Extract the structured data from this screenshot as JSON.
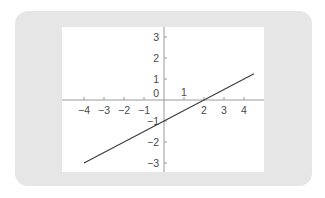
{
  "chart_data": {
    "type": "line",
    "title": "",
    "xlabel": "",
    "ylabel": "",
    "xlim": [
      -5,
      5
    ],
    "ylim": [
      -3.5,
      3.5
    ],
    "grid": false,
    "x_ticks": [
      -4,
      -3,
      -2,
      -1,
      1,
      2,
      3,
      4
    ],
    "y_ticks": [
      -3,
      -2,
      -1,
      1,
      2,
      3
    ],
    "x_tick_labels": [
      "−4",
      "−3",
      "−2",
      "−1",
      "1",
      "2",
      "3",
      "4"
    ],
    "y_tick_labels": [
      "−3",
      "−2",
      "−1",
      "1",
      "2",
      "3"
    ],
    "origin_label": "0",
    "series": [
      {
        "name": "y = 0.5x − 1",
        "x": [
          -4,
          4.5
        ],
        "y": [
          -3,
          1.25
        ],
        "color": "#3a3a3a"
      }
    ]
  },
  "colors": {
    "panel": "#e6e6e6",
    "plot_bg": "#ffffff",
    "axis": "#9a9a9a",
    "text": "#4a4a4a"
  }
}
